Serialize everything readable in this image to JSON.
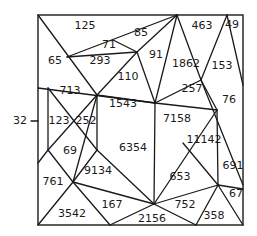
{
  "diagram": {
    "type": "triangulated-number-puzzle",
    "frame": {
      "x": 38,
      "y": 15,
      "width": 205,
      "height": 210
    },
    "side_label": {
      "text": "32",
      "x": 20,
      "y": 121,
      "tick": [
        [
          31,
          121
        ],
        [
          38,
          121
        ]
      ]
    },
    "regions": [
      {
        "id": "r125",
        "label": "125",
        "x": 85,
        "y": 26
      },
      {
        "id": "r71",
        "label": "71",
        "x": 109,
        "y": 45
      },
      {
        "id": "r85",
        "label": "85",
        "x": 141,
        "y": 33
      },
      {
        "id": "r65",
        "label": "65",
        "x": 55,
        "y": 61
      },
      {
        "id": "r293",
        "label": "293",
        "x": 100,
        "y": 61
      },
      {
        "id": "r91",
        "label": "91",
        "x": 156,
        "y": 55
      },
      {
        "id": "r110",
        "label": "110",
        "x": 128,
        "y": 77
      },
      {
        "id": "r1862",
        "label": "1862",
        "x": 186,
        "y": 64
      },
      {
        "id": "r463",
        "label": "463",
        "x": 202,
        "y": 26
      },
      {
        "id": "r49",
        "label": "49",
        "x": 232,
        "y": 25
      },
      {
        "id": "r153",
        "label": "153",
        "x": 222,
        "y": 66
      },
      {
        "id": "r257",
        "label": "257",
        "x": 192,
        "y": 89
      },
      {
        "id": "r76",
        "label": "76",
        "x": 229,
        "y": 100
      },
      {
        "id": "r713",
        "label": "713",
        "x": 70,
        "y": 91
      },
      {
        "id": "r1543",
        "label": "1543",
        "x": 123,
        "y": 104
      },
      {
        "id": "r7158",
        "label": "7158",
        "x": 177,
        "y": 119
      },
      {
        "id": "r123",
        "label": "123",
        "x": 59,
        "y": 121
      },
      {
        "id": "r252",
        "label": "252",
        "x": 86,
        "y": 121
      },
      {
        "id": "r11142",
        "label": "11142",
        "x": 204,
        "y": 140
      },
      {
        "id": "r6354",
        "label": "6354",
        "x": 133,
        "y": 148
      },
      {
        "id": "r69",
        "label": "69",
        "x": 70,
        "y": 151
      },
      {
        "id": "r691",
        "label": "691",
        "x": 233,
        "y": 166
      },
      {
        "id": "r653",
        "label": "653",
        "x": 180,
        "y": 177
      },
      {
        "id": "r9134",
        "label": "9134",
        "x": 98,
        "y": 171
      },
      {
        "id": "r761",
        "label": "761",
        "x": 53,
        "y": 182
      },
      {
        "id": "r67",
        "label": "67",
        "x": 236,
        "y": 194
      },
      {
        "id": "r167",
        "label": "167",
        "x": 112,
        "y": 205
      },
      {
        "id": "r752",
        "label": "752",
        "x": 185,
        "y": 205
      },
      {
        "id": "r3542",
        "label": "3542",
        "x": 72,
        "y": 214
      },
      {
        "id": "r2156",
        "label": "2156",
        "x": 152,
        "y": 219
      },
      {
        "id": "r358",
        "label": "358",
        "x": 214,
        "y": 216
      }
    ],
    "edges": [
      [
        [
          38,
          15
        ],
        [
          97,
          95
        ]
      ],
      [
        [
          67,
          57
        ],
        [
          177,
          15
        ]
      ],
      [
        [
          67,
          57
        ],
        [
          137,
          52
        ]
      ],
      [
        [
          113,
          40
        ],
        [
          137,
          52
        ]
      ],
      [
        [
          137,
          52
        ],
        [
          177,
          15
        ]
      ],
      [
        [
          97,
          95
        ],
        [
          137,
          52
        ]
      ],
      [
        [
          137,
          52
        ],
        [
          155,
          103
        ]
      ],
      [
        [
          155,
          103
        ],
        [
          177,
          15
        ]
      ],
      [
        [
          177,
          15
        ],
        [
          201,
          80
        ]
      ],
      [
        [
          201,
          80
        ],
        [
          227,
          15
        ]
      ],
      [
        [
          227,
          15
        ],
        [
          243,
          85
        ]
      ],
      [
        [
          201,
          80
        ],
        [
          217,
          110
        ]
      ],
      [
        [
          201,
          80
        ],
        [
          243,
          185
        ]
      ],
      [
        [
          155,
          103
        ],
        [
          201,
          80
        ]
      ],
      [
        [
          155,
          103
        ],
        [
          217,
          110
        ]
      ],
      [
        [
          38,
          88
        ],
        [
          155,
          103
        ]
      ],
      [
        [
          48,
          88
        ],
        [
          48,
          150
        ]
      ],
      [
        [
          97,
          95
        ],
        [
          97,
          150
        ]
      ],
      [
        [
          48,
          88
        ],
        [
          97,
          150
        ]
      ],
      [
        [
          97,
          95
        ],
        [
          48,
          150
        ]
      ],
      [
        [
          38,
          163
        ],
        [
          48,
          150
        ]
      ],
      [
        [
          97,
          95
        ],
        [
          155,
          103
        ]
      ],
      [
        [
          97,
          95
        ],
        [
          73,
          182
        ]
      ],
      [
        [
          48,
          150
        ],
        [
          73,
          182
        ]
      ],
      [
        [
          97,
          150
        ],
        [
          73,
          182
        ]
      ],
      [
        [
          155,
          103
        ],
        [
          154,
          204
        ]
      ],
      [
        [
          217,
          110
        ],
        [
          154,
          204
        ]
      ],
      [
        [
          183,
          143
        ],
        [
          218,
          185
        ]
      ],
      [
        [
          217,
          110
        ],
        [
          218,
          185
        ]
      ],
      [
        [
          73,
          182
        ],
        [
          154,
          204
        ]
      ],
      [
        [
          73,
          182
        ],
        [
          38,
          225
        ]
      ],
      [
        [
          73,
          182
        ],
        [
          110,
          225
        ]
      ],
      [
        [
          110,
          225
        ],
        [
          154,
          204
        ]
      ],
      [
        [
          154,
          204
        ],
        [
          218,
          185
        ]
      ],
      [
        [
          154,
          204
        ],
        [
          196,
          225
        ]
      ],
      [
        [
          196,
          225
        ],
        [
          218,
          185
        ]
      ],
      [
        [
          218,
          185
        ],
        [
          243,
          189
        ]
      ],
      [
        [
          218,
          185
        ],
        [
          243,
          225
        ]
      ],
      [
        [
          97,
          150
        ],
        [
          154,
          204
        ]
      ]
    ]
  }
}
